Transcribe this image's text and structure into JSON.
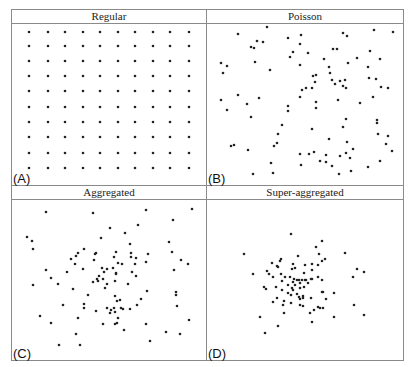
{
  "figure": {
    "frame": {
      "left": 11,
      "top": 9,
      "right": 403,
      "bottom": 360,
      "mid_x": 206,
      "mid_y": 185,
      "title_height": 13,
      "line_color": "#8a8a8a"
    },
    "point_color": "#222222",
    "point_radius": 1.3
  },
  "chart_data": [
    {
      "type": "scatter",
      "title": "Regular",
      "panel_label": "(A)",
      "description": "10 x 10 regular grid of points",
      "grid": {
        "columns_px": [
          29,
          48,
          65,
          83,
          100,
          118,
          135,
          153,
          170,
          189
        ],
        "rows_px": [
          32,
          46,
          61,
          76,
          91,
          107,
          122,
          137,
          153,
          168
        ]
      }
    },
    {
      "type": "scatter",
      "title": "Poisson",
      "panel_label": "(B)",
      "points_px": [
        [
          267,
          27
        ],
        [
          238,
          34
        ],
        [
          288,
          38
        ],
        [
          301,
          35
        ],
        [
          343,
          33
        ],
        [
          347,
          36
        ],
        [
          374,
          30
        ],
        [
          393,
          32
        ],
        [
          257,
          41
        ],
        [
          263,
          42
        ],
        [
          251,
          47
        ],
        [
          254,
          48
        ],
        [
          300,
          44
        ],
        [
          333,
          49
        ],
        [
          337,
          49
        ],
        [
          370,
          51
        ],
        [
          293,
          52
        ],
        [
          290,
          57
        ],
        [
          308,
          53
        ],
        [
          255,
          62
        ],
        [
          221,
          63
        ],
        [
          227,
          66
        ],
        [
          223,
          73
        ],
        [
          270,
          70
        ],
        [
          300,
          65
        ],
        [
          324,
          59
        ],
        [
          348,
          63
        ],
        [
          357,
          58
        ],
        [
          380,
          59
        ],
        [
          368,
          67
        ],
        [
          329,
          67
        ],
        [
          330,
          73
        ],
        [
          313,
          76
        ],
        [
          316,
          75
        ],
        [
          315,
          82
        ],
        [
          332,
          80
        ],
        [
          335,
          84
        ],
        [
          340,
          81
        ],
        [
          345,
          80
        ],
        [
          343,
          86
        ],
        [
          346,
          88
        ],
        [
          369,
          78
        ],
        [
          376,
          79
        ],
        [
          381,
          87
        ],
        [
          388,
          88
        ],
        [
          312,
          88
        ],
        [
          306,
          88
        ],
        [
          302,
          90
        ],
        [
          300,
          97
        ],
        [
          238,
          95
        ],
        [
          221,
          100
        ],
        [
          259,
          98
        ],
        [
          247,
          104
        ],
        [
          227,
          110
        ],
        [
          288,
          106
        ],
        [
          288,
          111
        ],
        [
          316,
          102
        ],
        [
          316,
          108
        ],
        [
          338,
          100
        ],
        [
          360,
          103
        ],
        [
          373,
          97
        ],
        [
          251,
          117
        ],
        [
          346,
          119
        ],
        [
          377,
          120
        ],
        [
          377,
          123
        ],
        [
          282,
          125
        ],
        [
          343,
          127
        ],
        [
          312,
          129
        ],
        [
          278,
          134
        ],
        [
          378,
          134
        ],
        [
          388,
          136
        ],
        [
          329,
          139
        ],
        [
          231,
          146
        ],
        [
          234,
          145
        ],
        [
          277,
          143
        ],
        [
          274,
          146
        ],
        [
          248,
          150
        ],
        [
          347,
          142
        ],
        [
          353,
          149
        ],
        [
          386,
          144
        ],
        [
          392,
          151
        ],
        [
          300,
          154
        ],
        [
          309,
          154
        ],
        [
          314,
          152
        ],
        [
          326,
          155
        ],
        [
          340,
          156
        ],
        [
          346,
          153
        ],
        [
          350,
          158
        ],
        [
          320,
          161
        ],
        [
          326,
          162
        ],
        [
          332,
          166
        ],
        [
          301,
          165
        ],
        [
          271,
          163
        ],
        [
          368,
          167
        ],
        [
          380,
          161
        ],
        [
          253,
          174
        ],
        [
          273,
          173
        ],
        [
          339,
          174
        ],
        [
          351,
          171
        ]
      ]
    },
    {
      "type": "scatter",
      "title": "Aggregated",
      "panel_label": "(C)",
      "points_px": [
        [
          46,
          212
        ],
        [
          93,
          213
        ],
        [
          146,
          210
        ],
        [
          192,
          209
        ],
        [
          173,
          220
        ],
        [
          138,
          225
        ],
        [
          110,
          228
        ],
        [
          125,
          233
        ],
        [
          27,
          237
        ],
        [
          32,
          241
        ],
        [
          33,
          249
        ],
        [
          101,
          238
        ],
        [
          130,
          244
        ],
        [
          169,
          242
        ],
        [
          84,
          249
        ],
        [
          78,
          253
        ],
        [
          76,
          256
        ],
        [
          71,
          259
        ],
        [
          75,
          264
        ],
        [
          96,
          253
        ],
        [
          95,
          254
        ],
        [
          94,
          260
        ],
        [
          116,
          252
        ],
        [
          114,
          257
        ],
        [
          131,
          253
        ],
        [
          131,
          257
        ],
        [
          136,
          258
        ],
        [
          148,
          254
        ],
        [
          146,
          262
        ],
        [
          172,
          252
        ],
        [
          181,
          260
        ],
        [
          188,
          264
        ],
        [
          118,
          263
        ],
        [
          122,
          264
        ],
        [
          135,
          264
        ],
        [
          46,
          270
        ],
        [
          67,
          272
        ],
        [
          83,
          269
        ],
        [
          102,
          268
        ],
        [
          107,
          269
        ],
        [
          113,
          268
        ],
        [
          104,
          272
        ],
        [
          116,
          273
        ],
        [
          116,
          274
        ],
        [
          132,
          272
        ],
        [
          136,
          276
        ],
        [
          174,
          270
        ],
        [
          51,
          278
        ],
        [
          99,
          276
        ],
        [
          97,
          279
        ],
        [
          103,
          279
        ],
        [
          93,
          282
        ],
        [
          98,
          281
        ],
        [
          115,
          281
        ],
        [
          107,
          284
        ],
        [
          128,
          284
        ],
        [
          33,
          285
        ],
        [
          58,
          284
        ],
        [
          105,
          288
        ],
        [
          73,
          289
        ],
        [
          88,
          295
        ],
        [
          115,
          296
        ],
        [
          120,
          300
        ],
        [
          117,
          301
        ],
        [
          147,
          291
        ],
        [
          141,
          299
        ],
        [
          176,
          292
        ],
        [
          176,
          295
        ],
        [
          177,
          306
        ],
        [
          137,
          305
        ],
        [
          63,
          305
        ],
        [
          84,
          304
        ],
        [
          84,
          308
        ],
        [
          107,
          308
        ],
        [
          111,
          310
        ],
        [
          114,
          308
        ],
        [
          115,
          312
        ],
        [
          110,
          313
        ],
        [
          121,
          308
        ],
        [
          123,
          309
        ],
        [
          130,
          309
        ],
        [
          96,
          311
        ],
        [
          118,
          318
        ],
        [
          78,
          318
        ],
        [
          40,
          316
        ],
        [
          189,
          320
        ],
        [
          51,
          323
        ],
        [
          103,
          324
        ],
        [
          115,
          324
        ],
        [
          117,
          323
        ],
        [
          146,
          324
        ],
        [
          166,
          332
        ],
        [
          180,
          334
        ],
        [
          124,
          330
        ],
        [
          76,
          334
        ],
        [
          150,
          341
        ],
        [
          59,
          345
        ],
        [
          80,
          345
        ]
      ]
    },
    {
      "type": "scatter",
      "title": "Super-aggregated",
      "panel_label": "(D)",
      "points_px": [
        [
          291,
          234
        ],
        [
          322,
          241
        ],
        [
          316,
          247
        ],
        [
          244,
          254
        ],
        [
          345,
          253
        ],
        [
          298,
          256
        ],
        [
          319,
          254
        ],
        [
          325,
          259
        ],
        [
          322,
          261
        ],
        [
          281,
          259
        ],
        [
          280,
          261
        ],
        [
          272,
          263
        ],
        [
          277,
          266
        ],
        [
          278,
          267
        ],
        [
          293,
          264
        ],
        [
          305,
          265
        ],
        [
          312,
          264
        ],
        [
          318,
          265
        ],
        [
          295,
          268
        ],
        [
          292,
          269
        ],
        [
          267,
          271
        ],
        [
          269,
          274
        ],
        [
          281,
          274
        ],
        [
          312,
          270
        ],
        [
          304,
          273
        ],
        [
          357,
          269
        ],
        [
          364,
          272
        ],
        [
          253,
          274
        ],
        [
          285,
          277
        ],
        [
          273,
          277
        ],
        [
          290,
          277
        ],
        [
          318,
          277
        ],
        [
          353,
          277
        ],
        [
          294,
          279
        ],
        [
          297,
          280
        ],
        [
          299,
          280
        ],
        [
          302,
          280
        ],
        [
          305,
          280
        ],
        [
          306,
          280
        ],
        [
          311,
          279
        ],
        [
          312,
          279
        ],
        [
          322,
          280
        ],
        [
          282,
          281
        ],
        [
          293,
          282
        ],
        [
          300,
          283
        ],
        [
          288,
          285
        ],
        [
          295,
          285
        ],
        [
          308,
          283
        ],
        [
          264,
          287
        ],
        [
          266,
          289
        ],
        [
          276,
          287
        ],
        [
          282,
          290
        ],
        [
          292,
          288
        ],
        [
          293,
          290
        ],
        [
          300,
          288
        ],
        [
          304,
          287
        ],
        [
          288,
          293
        ],
        [
          291,
          295
        ],
        [
          297,
          294
        ],
        [
          299,
          297
        ],
        [
          303,
          296
        ],
        [
          300,
          299
        ],
        [
          303,
          298
        ],
        [
          322,
          292
        ],
        [
          323,
          292
        ],
        [
          334,
          293
        ],
        [
          277,
          298
        ],
        [
          273,
          302
        ],
        [
          284,
          301
        ],
        [
          291,
          303
        ],
        [
          311,
          298
        ],
        [
          326,
          299
        ],
        [
          300,
          305
        ],
        [
          303,
          306
        ],
        [
          283,
          305
        ],
        [
          318,
          307
        ],
        [
          320,
          308
        ],
        [
          323,
          308
        ],
        [
          354,
          305
        ],
        [
          314,
          310
        ],
        [
          310,
          313
        ],
        [
          284,
          313
        ],
        [
          334,
          317
        ],
        [
          364,
          315
        ],
        [
          260,
          317
        ],
        [
          312,
          322
        ],
        [
          278,
          326
        ],
        [
          265,
          333
        ]
      ]
    }
  ]
}
